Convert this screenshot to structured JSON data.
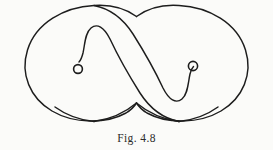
{
  "figure": {
    "caption": "Fig. 4.8",
    "caption_prefix": "Fig.",
    "caption_number": "4.8",
    "background_color": "#fbfbf9",
    "ink_color": "#1d1d1d",
    "canvas": {
      "width": 273,
      "height": 150
    },
    "elements": {
      "left_lobe": {
        "name": "left-lobe",
        "center_x": 80,
        "center_y": 66
      },
      "right_lobe": {
        "name": "right-lobe",
        "center_x": 193,
        "center_y": 66
      },
      "left_spiral_dot": {
        "name": "left-spiral-endpoint",
        "cx": 78,
        "cy": 69,
        "r": 4.4
      },
      "right_spiral_dot": {
        "name": "right-spiral-endpoint",
        "cx": 193,
        "cy": 66,
        "r": 4.6
      },
      "crossing_top": {
        "name": "top-crossing",
        "x": 136,
        "y": 17
      },
      "crossing_bottom": {
        "name": "bottom-crossing",
        "x": 136,
        "y": 115
      }
    }
  }
}
